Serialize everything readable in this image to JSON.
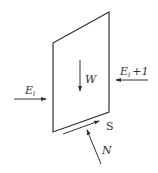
{
  "diagram": {
    "type": "free-body force diagram of a slice",
    "colors": {
      "stroke": "#333333",
      "background": "#ffffff"
    },
    "slice": {
      "shape": "parallelogram",
      "points": [
        [
          53,
          43
        ],
        [
          109,
          12
        ],
        [
          109,
          112
        ],
        [
          53,
          132
        ]
      ]
    },
    "forces": [
      {
        "id": "weight",
        "label": "W",
        "direction": "down"
      },
      {
        "id": "left-interslice",
        "label_main": "E",
        "label_sub": "i",
        "direction": "right"
      },
      {
        "id": "right-interslice",
        "label_main": "E",
        "label_sub": "i",
        "label_suffix": "+1",
        "direction": "left"
      },
      {
        "id": "shear",
        "label": "S",
        "direction": "up-slope along base"
      },
      {
        "id": "normal",
        "label": "N",
        "direction": "normal to base, upward"
      }
    ]
  }
}
